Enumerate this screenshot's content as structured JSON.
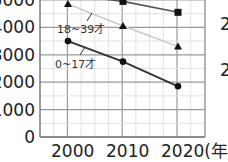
{
  "chart_data": {
    "type": "line",
    "title": "",
    "xlabel": "(年)",
    "ylabel": "",
    "x": [
      2000,
      2010,
      2020
    ],
    "x_tick_labels": [
      "2000",
      "2010",
      "2020(年)"
    ],
    "y_tick_labels": [
      "0",
      "1000",
      "2000",
      "3000",
      "4000",
      "5000"
    ],
    "ylim": [
      0,
      5000
    ],
    "grid": true,
    "series": [
      {
        "name": "top series (square)",
        "marker": "square",
        "color": "#555555",
        "values": [
          null,
          4950,
          4550
        ]
      },
      {
        "name": "18~39才",
        "marker": "triangle",
        "color": "#cccccc",
        "values": [
          4850,
          4050,
          3300
        ]
      },
      {
        "name": "0~17才",
        "marker": "circle",
        "color": "#333333",
        "values": [
          3500,
          2750,
          1850
        ]
      }
    ],
    "annotations": [
      "18~39才",
      "0~17才"
    ],
    "edge_fragments": [
      "2",
      "2"
    ]
  }
}
